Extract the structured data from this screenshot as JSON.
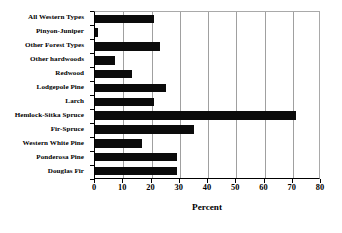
{
  "chart_data": {
    "type": "bar",
    "orientation": "horizontal",
    "title": "",
    "xlabel": "Percent",
    "ylabel": "",
    "xlim": [
      0,
      80
    ],
    "xticks": [
      0,
      10,
      20,
      30,
      40,
      50,
      60,
      70,
      80
    ],
    "grid": true,
    "legend": false,
    "bar_color": "#0b0b0b",
    "categories": [
      "All Western Types",
      "Pinyon-Juniper",
      "Other Forest Types",
      "Other hardwoods",
      "Redwood",
      "Lodgepole Pine",
      "Larch",
      "Hemlock-Sitka Spruce",
      "Fir-Spruce",
      "Western White Pine",
      "Ponderosa Pine",
      "Douglas Fir"
    ],
    "values": [
      21,
      1,
      23,
      7,
      13,
      25,
      21,
      71,
      35,
      16.5,
      29,
      29
    ]
  },
  "axis": {
    "x_title": "Percent",
    "tick_labels": [
      "0",
      "10",
      "20",
      "30",
      "40",
      "50",
      "60",
      "70",
      "80"
    ]
  }
}
